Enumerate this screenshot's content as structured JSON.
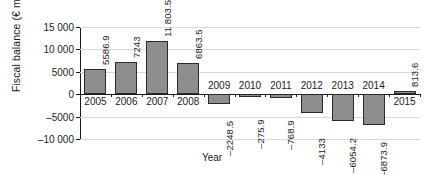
{
  "chart_data": {
    "type": "bar",
    "title": "",
    "subtitle": "",
    "xlabel": "Year",
    "ylabel": "Fiscal balance (€ million)",
    "categories": [
      "2005",
      "2006",
      "2007",
      "2008",
      "2009",
      "2010",
      "2011",
      "2012",
      "2013",
      "2014",
      "2015"
    ],
    "values": [
      5586.9,
      7243,
      11803.5,
      6863.5,
      -2248.5,
      -275.9,
      -768.9,
      -4133,
      -6054.2,
      -6873.9,
      813.6
    ],
    "value_labels": [
      "5586.9",
      "7243",
      "11 803.5",
      "6863.5",
      "–2248.5",
      "–275.9",
      "–768.9",
      "–4133",
      "–6054.2",
      "–6873.9",
      "813.6"
    ],
    "ylim": [
      -10000,
      15000
    ],
    "yticks": [
      15000,
      10000,
      5000,
      0,
      -5000,
      -10000
    ],
    "ytick_labels": [
      "15 000",
      "10 000",
      "5000",
      "0",
      "–5000",
      "–10 000"
    ],
    "grid": true,
    "grid_axis": "y",
    "legend": null,
    "legend_position": "none",
    "series": [
      {
        "name": "Fiscal balance",
        "values": [
          5586.9,
          7243,
          11803.5,
          6863.5,
          -2248.5,
          -275.9,
          -768.9,
          -4133,
          -6054.2,
          -6873.9,
          813.6
        ]
      }
    ],
    "colors": {
      "bar_fill": "#8e8e8e",
      "bar_border": "#2b2b2b",
      "gridline": "#d8d8d8",
      "axis": "#1a1a1a",
      "background": "#ffffff",
      "text": "#1a1a1a"
    },
    "label_rotation": 90,
    "value_label_placement": "outside"
  }
}
